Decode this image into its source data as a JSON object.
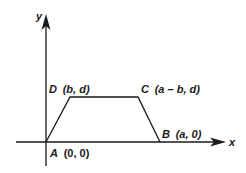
{
  "diagram": {
    "type": "coordinate-geometry",
    "axes": {
      "x_label": "x",
      "y_label": "y"
    },
    "vertices": [
      {
        "name": "A",
        "coords": "(0, 0)",
        "label": "A (0, 0)"
      },
      {
        "name": "B",
        "coords": "(a, 0)",
        "label": "B (a, 0)"
      },
      {
        "name": "C",
        "coords": "(a – b, d)",
        "label": "C (a – b, d)"
      },
      {
        "name": "D",
        "coords": "(b, d)",
        "label": "D (b, d)"
      }
    ],
    "labels": {
      "A_letter": "A",
      "A_coords": "(0, 0)",
      "B_letter": "B",
      "B_coords": "(a, 0)",
      "C_letter": "C",
      "C_coords": "(a – b, d)",
      "D_letter": "D",
      "D_coords": "(b, d)"
    },
    "colors": {
      "stroke": "#1a1a1a",
      "background": "#ffffff"
    }
  }
}
